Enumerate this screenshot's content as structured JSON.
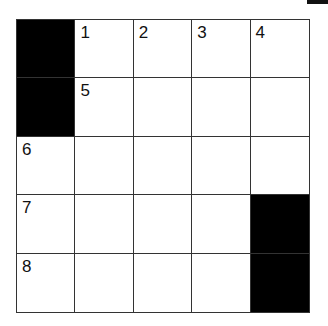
{
  "puzzle": {
    "rows": 5,
    "cols": 5,
    "cells": [
      [
        {
          "black": true
        },
        {
          "num": "1"
        },
        {
          "num": "2"
        },
        {
          "num": "3"
        },
        {
          "num": "4"
        }
      ],
      [
        {
          "black": true
        },
        {
          "num": "5"
        },
        {},
        {},
        {}
      ],
      [
        {
          "num": "6"
        },
        {},
        {},
        {},
        {}
      ],
      [
        {
          "num": "7"
        },
        {},
        {},
        {},
        {
          "black": true
        }
      ],
      [
        {
          "num": "8"
        },
        {},
        {},
        {},
        {
          "black": true
        }
      ]
    ]
  },
  "colors": {
    "block": "#000000",
    "line": "#333333",
    "background": "#ffffff"
  }
}
